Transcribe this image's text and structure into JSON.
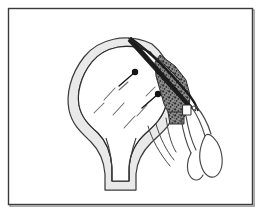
{
  "figure": {
    "kind": "line-art-illustration",
    "title": "",
    "caption": "",
    "background_color": "#ffffff",
    "canvas": {
      "width": 260,
      "height": 212
    }
  },
  "frame": {
    "name": "illustration-border",
    "stroke_color": "#3a3a3a",
    "shadow_color": "#9a9a9a",
    "stroke_width": 1.4,
    "inset": {
      "x": 8,
      "y": 8,
      "width": 244,
      "height": 196
    }
  },
  "palette": {
    "outline": "#2b2b2b",
    "band_fill": "#e9e9e9",
    "band_stroke": "#3d3d3d",
    "body_fill": "#ffffff",
    "stipple_fill": "#7d7d7d",
    "stipple_stroke": "#2f2f2f",
    "blade_fill": "#1d1d1d",
    "pin_fill": "#171717",
    "dash_stroke": "#666666",
    "instrument_stroke": "#444444"
  },
  "elements": {
    "anatomy_body": {
      "name": "anatomical-body-shape",
      "label": "domed structure with tapering stem",
      "fill": "#ffffff",
      "stroke": "#2b2b2b"
    },
    "cortical_band": {
      "name": "cortical-gray-band",
      "label": "thick light-gray crescent rim following the dome and stem",
      "fill": "#e9e9e9",
      "stroke": "#3d3d3d"
    },
    "stem_notch": {
      "name": "stem-v-notch",
      "label": "V shaped cleft at base of stem"
    },
    "stippled_region": {
      "name": "stippled-tissue-region",
      "label": "dark mottled band along upper right margin",
      "fill": "#7d7d7d"
    },
    "blade": {
      "name": "needle-blade",
      "label": "sharp dark pointed instrument tip entering from upper left"
    },
    "pins": [
      {
        "name": "marker-pin-upper",
        "x": 134,
        "y": 73,
        "head_radius": 3.1,
        "angle_deg": 215
      },
      {
        "name": "marker-pin-lower",
        "x": 156,
        "y": 95,
        "head_radius": 3.1,
        "angle_deg": 215
      }
    ],
    "dashes": {
      "name": "radiating-dashed-lines",
      "count": 7,
      "stroke": "#666666"
    },
    "instrument": {
      "name": "surgical-forceps",
      "label": "two elongated finger loops with shanks",
      "loops": 2,
      "stroke": "#444444"
    }
  },
  "annotations": {
    "has_text_labels": false,
    "visible_text": ""
  }
}
